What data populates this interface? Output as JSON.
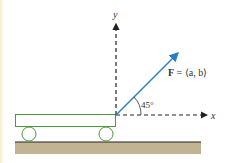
{
  "diagram": {
    "axes": {
      "x_label": "x",
      "y_label": "y",
      "style": "dashed"
    },
    "force": {
      "label_bold": "F",
      "label_rest": " = ⟨a, b⟩",
      "color": "#2a7fc1"
    },
    "angle": {
      "label": "45°",
      "value_deg": 45
    },
    "cart": {
      "color": "#4a9a3a",
      "wheels": 2
    },
    "ground": {
      "color": "#c2b393",
      "line_color": "#222222"
    }
  }
}
